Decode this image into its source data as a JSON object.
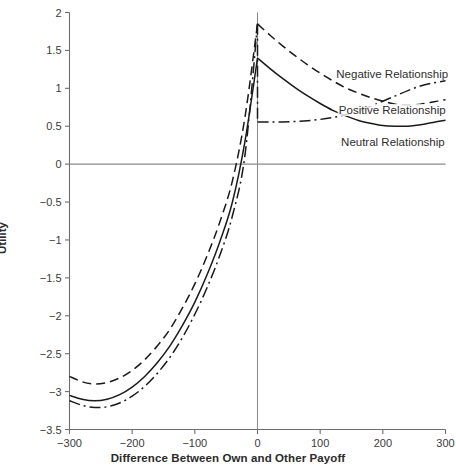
{
  "chart_data": {
    "type": "line",
    "title": "",
    "xlabel": "Difference Between Own and Other Payoff",
    "ylabel": "Utility",
    "xlim": [
      -300,
      300
    ],
    "ylim": [
      -3.5,
      2
    ],
    "grid": false,
    "legend_position": "inline-right",
    "xticks": [
      "−300",
      "−200",
      "−100",
      "0",
      "100",
      "200",
      "300"
    ],
    "xtick_values": [
      -300,
      -200,
      -100,
      0,
      100,
      200,
      300
    ],
    "yticks": [
      "2",
      "1.5",
      "1",
      "0.5",
      "0",
      "−0.5",
      "−1",
      "−1.5",
      "−2",
      "−2.5",
      "−3",
      "−3.5"
    ],
    "ytick_values": [
      2,
      1.5,
      1,
      0.5,
      0,
      -0.5,
      -1,
      -1.5,
      -2,
      -2.5,
      -3,
      -3.5
    ],
    "zero_line_y": 0,
    "x": [
      -300,
      -280,
      -260,
      -240,
      -220,
      -200,
      -180,
      -160,
      -140,
      -120,
      -100,
      -80,
      -60,
      -40,
      -20,
      0,
      20,
      40,
      60,
      80,
      100,
      120,
      140,
      160,
      180,
      200,
      220,
      240,
      260,
      280,
      300
    ],
    "series": [
      {
        "name": "Negative Relationship",
        "label": "Negative Relationship",
        "style": "dashed",
        "dasharray": "9,5",
        "color": "#1a1a1a",
        "values": [
          -2.8,
          -2.87,
          -2.9,
          -2.88,
          -2.82,
          -2.72,
          -2.58,
          -2.4,
          -2.18,
          -1.9,
          -1.58,
          -1.2,
          -0.76,
          -0.22,
          0.62,
          1.85,
          1.7,
          1.56,
          1.43,
          1.31,
          1.2,
          1.1,
          1.01,
          0.94,
          0.88,
          0.83,
          0.79,
          0.78,
          0.79,
          0.82,
          0.85
        ],
        "label_x": 215,
        "label_y": 1.18
      },
      {
        "name": "Neutral Relationship",
        "label": "Neutral Relationship",
        "style": "solid",
        "dasharray": "none",
        "color": "#1a1a1a",
        "values": [
          -3.05,
          -3.1,
          -3.12,
          -3.1,
          -3.04,
          -2.94,
          -2.8,
          -2.62,
          -2.4,
          -2.13,
          -1.82,
          -1.45,
          -1.02,
          -0.5,
          0.3,
          1.4,
          1.26,
          1.13,
          1.01,
          0.9,
          0.8,
          0.71,
          0.64,
          0.58,
          0.54,
          0.51,
          0.5,
          0.5,
          0.52,
          0.55,
          0.58
        ],
        "label_x": 216,
        "label_y": 0.28
      },
      {
        "name": "Positive Relationship",
        "label": "Positive Relationship",
        "style": "dashdot",
        "dasharray": "11,4,2,4",
        "color": "#1a1a1a",
        "values": [
          -3.12,
          -3.18,
          -3.21,
          -3.2,
          -3.15,
          -3.06,
          -2.93,
          -2.76,
          -2.55,
          -2.29,
          -1.98,
          -1.62,
          -1.2,
          -0.68,
          0.12,
          1.85,
          0.555,
          0.556,
          0.562,
          0.573,
          0.59,
          0.615,
          0.65,
          0.7,
          0.76,
          0.83,
          0.9,
          0.97,
          1.03,
          1.07,
          1.1
        ],
        "label_x": 215,
        "label_y": 0.7,
        "note": "Positive relationship drops vertically at x=0 from peak 1.85 to 0.555"
      }
    ],
    "annotations": [
      {
        "text": "Negative Relationship",
        "x": 215,
        "y": 1.18
      },
      {
        "text": "Positive Relationship",
        "x": 215,
        "y": 0.7
      },
      {
        "text": "Neutral Relationship",
        "x": 216,
        "y": 0.28
      }
    ]
  },
  "axes": {
    "frame_color": "#6e6e6e",
    "zero_line_color": "#8a8a8a",
    "vertical_zero_color": "#8a8a8a"
  }
}
